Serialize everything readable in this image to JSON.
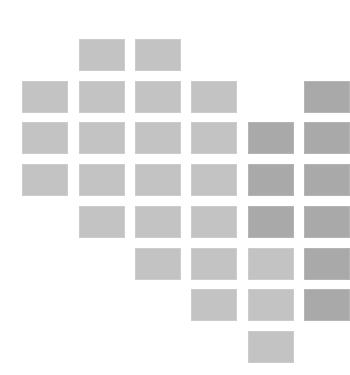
{
  "canvas": {
    "width": 335,
    "height": 375,
    "background": "#ffffff"
  },
  "colors": {
    "light": "#c3c3c3",
    "dark": "#a9a9a9"
  },
  "grid": {
    "column_x": [
      22,
      79,
      135,
      191,
      248,
      304
    ],
    "row_y": [
      39,
      81,
      122,
      164,
      206,
      248,
      289,
      331
    ],
    "tile_width": 46,
    "tile_height": 32
  },
  "tiles": [
    {
      "row": 0,
      "col": 1,
      "shade": "light"
    },
    {
      "row": 0,
      "col": 2,
      "shade": "light"
    },
    {
      "row": 1,
      "col": 0,
      "shade": "light"
    },
    {
      "row": 1,
      "col": 1,
      "shade": "light"
    },
    {
      "row": 1,
      "col": 2,
      "shade": "light"
    },
    {
      "row": 1,
      "col": 3,
      "shade": "light"
    },
    {
      "row": 1,
      "col": 5,
      "shade": "dark"
    },
    {
      "row": 2,
      "col": 0,
      "shade": "light"
    },
    {
      "row": 2,
      "col": 1,
      "shade": "light"
    },
    {
      "row": 2,
      "col": 2,
      "shade": "light"
    },
    {
      "row": 2,
      "col": 3,
      "shade": "light"
    },
    {
      "row": 2,
      "col": 4,
      "shade": "dark"
    },
    {
      "row": 2,
      "col": 5,
      "shade": "dark"
    },
    {
      "row": 3,
      "col": 0,
      "shade": "light"
    },
    {
      "row": 3,
      "col": 1,
      "shade": "light"
    },
    {
      "row": 3,
      "col": 2,
      "shade": "light"
    },
    {
      "row": 3,
      "col": 3,
      "shade": "light"
    },
    {
      "row": 3,
      "col": 4,
      "shade": "dark"
    },
    {
      "row": 3,
      "col": 5,
      "shade": "dark"
    },
    {
      "row": 4,
      "col": 1,
      "shade": "light"
    },
    {
      "row": 4,
      "col": 2,
      "shade": "light"
    },
    {
      "row": 4,
      "col": 3,
      "shade": "light"
    },
    {
      "row": 4,
      "col": 4,
      "shade": "dark"
    },
    {
      "row": 4,
      "col": 5,
      "shade": "dark"
    },
    {
      "row": 5,
      "col": 2,
      "shade": "light"
    },
    {
      "row": 5,
      "col": 3,
      "shade": "light"
    },
    {
      "row": 5,
      "col": 4,
      "shade": "light"
    },
    {
      "row": 5,
      "col": 5,
      "shade": "dark"
    },
    {
      "row": 6,
      "col": 3,
      "shade": "light"
    },
    {
      "row": 6,
      "col": 4,
      "shade": "light"
    },
    {
      "row": 6,
      "col": 5,
      "shade": "dark"
    },
    {
      "row": 7,
      "col": 4,
      "shade": "light"
    }
  ]
}
